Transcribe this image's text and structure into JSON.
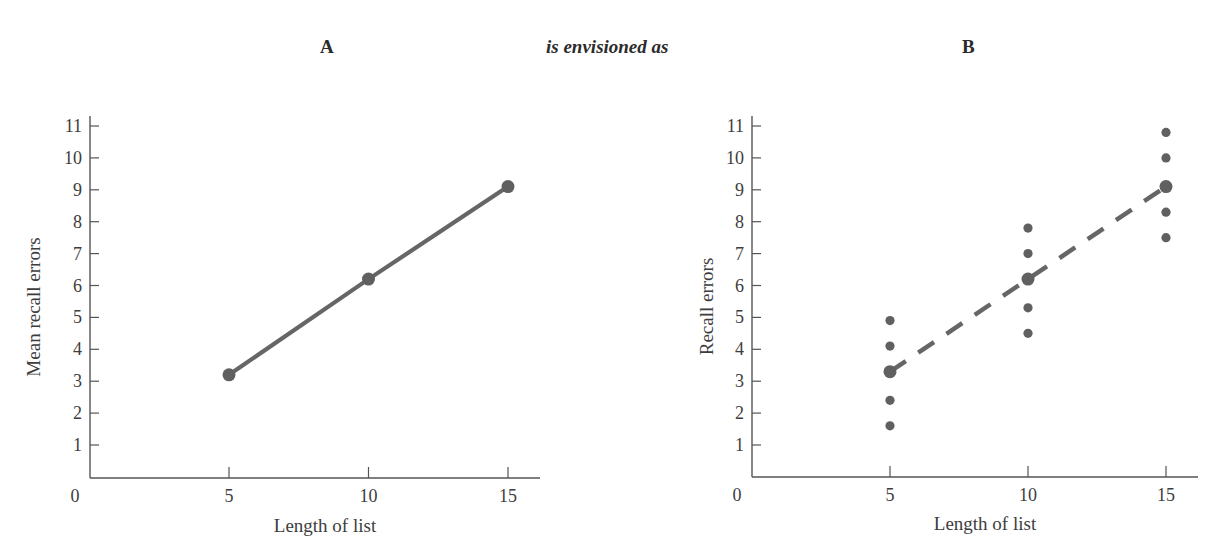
{
  "headings": {
    "left": "A",
    "middle": "is envisioned as",
    "right": "B"
  },
  "style": {
    "axis_color": "#555555",
    "line_color": "#666666",
    "point_color": "#606060",
    "text_color": "#3d3d3d"
  },
  "chart_data": [
    {
      "id": "A",
      "type": "line",
      "title": "A",
      "xlabel": "Length of list",
      "ylabel": "Mean recall errors",
      "x_ticks": [
        5,
        10,
        15
      ],
      "y_ticks": [
        1,
        2,
        3,
        4,
        5,
        6,
        7,
        8,
        9,
        10,
        11
      ],
      "origin_label": "0",
      "xlim": [
        0,
        16
      ],
      "ylim": [
        0,
        11
      ],
      "grid": false,
      "series": [
        {
          "name": "Mean recall errors",
          "style": "solid",
          "x": [
            5,
            10,
            15
          ],
          "y": [
            3.2,
            6.2,
            9.1
          ]
        }
      ]
    },
    {
      "id": "B",
      "type": "scatter",
      "title": "B",
      "xlabel": "Length of list",
      "ylabel": "Recall errors",
      "x_ticks": [
        5,
        10,
        15
      ],
      "y_ticks": [
        1,
        2,
        3,
        4,
        5,
        6,
        7,
        8,
        9,
        10,
        11
      ],
      "origin_label": "0",
      "xlim": [
        0,
        16
      ],
      "ylim": [
        0,
        11
      ],
      "grid": false,
      "series": [
        {
          "name": "Individual scores",
          "style": "points",
          "points": [
            {
              "x": 5,
              "y": 4.9
            },
            {
              "x": 5,
              "y": 4.1
            },
            {
              "x": 5,
              "y": 2.4
            },
            {
              "x": 5,
              "y": 1.6
            },
            {
              "x": 10,
              "y": 7.8
            },
            {
              "x": 10,
              "y": 7.0
            },
            {
              "x": 10,
              "y": 5.3
            },
            {
              "x": 10,
              "y": 4.5
            },
            {
              "x": 15,
              "y": 10.8
            },
            {
              "x": 15,
              "y": 10.0
            },
            {
              "x": 15,
              "y": 8.3
            },
            {
              "x": 15,
              "y": 7.5
            }
          ]
        },
        {
          "name": "Means",
          "style": "dashed",
          "x": [
            5,
            10,
            15
          ],
          "y": [
            3.3,
            6.2,
            9.1
          ]
        }
      ]
    }
  ]
}
